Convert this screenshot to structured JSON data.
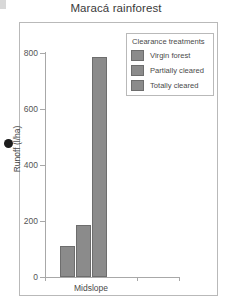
{
  "chart_data": {
    "type": "bar",
    "title": "Maracá rainforest",
    "xlabel": "",
    "ylabel": "Runoff (l/ha)",
    "categories": [
      "Midslope"
    ],
    "ylim": [
      0,
      800
    ],
    "yticks": [
      0,
      200,
      400,
      600,
      800
    ],
    "ytick_labels": [
      "0",
      "200",
      "400",
      "600",
      "800"
    ],
    "grid": false,
    "legend_position": "top-right",
    "legend_title": "Clearance treatments",
    "series": [
      {
        "name": "Virgin forest",
        "values": [
          110
        ],
        "color": "#8b8b8b"
      },
      {
        "name": "Partially cleared",
        "values": [
          185
        ],
        "color": "#8b8b8b"
      },
      {
        "name": "Totally cleared",
        "values": [
          787
        ],
        "color": "#8b8b8b"
      }
    ]
  },
  "colors": {
    "bar_fill": "#8b8b8b",
    "bar_outline": "#6d6d6d",
    "axis": "#a8a8a8",
    "frame": "#b9b9b9",
    "text": "#4a4a4a"
  }
}
